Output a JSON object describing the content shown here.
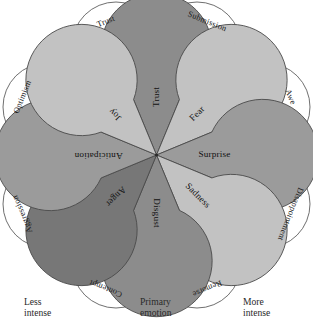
{
  "figure": {
    "background_color": "#ffffff",
    "stroke_color": "#4a4a4a"
  },
  "chart_data": {
    "type": "pie",
    "xlabel": "",
    "ylabel": "",
    "legend_position": "none",
    "grid": false,
    "categories": [
      "Trust",
      "Fear",
      "Surprise",
      "Sadness",
      "Disgust",
      "Anger",
      "Anticipation",
      "Joy"
    ],
    "values": [
      45,
      45,
      45,
      45,
      45,
      45,
      45,
      45
    ],
    "series": [
      {
        "name": "Primary emotions",
        "values": [
          45,
          45,
          45,
          45,
          45,
          45,
          45,
          45
        ]
      }
    ],
    "annotations": [
      "Less",
      "Primary",
      "More"
    ]
  },
  "petals": [
    {
      "label": "Trust",
      "color": "#8c8c8c",
      "angle": -90,
      "rotation": -90,
      "text_x": 156.5,
      "text_y": 96
    },
    {
      "label": "Fear",
      "color": "#c2c2c2",
      "angle": -45,
      "rotation": -45,
      "text_x": 198,
      "text_y": 110
    },
    {
      "label": "Surprise",
      "color": "#9b9b9b",
      "angle": 0,
      "rotation": 0,
      "text_x": 218,
      "text_y": 155
    },
    {
      "label": "Sadness",
      "color": "#c2c2c2",
      "angle": 45,
      "rotation": 45,
      "text_x": 198,
      "text_y": 200
    },
    {
      "label": "Disgust",
      "color": "#8c8c8c",
      "angle": 90,
      "rotation": 90,
      "text_x": 156.5,
      "text_y": 215
    },
    {
      "label": "Anger",
      "color": "#777777",
      "angle": 135,
      "rotation": 135,
      "text_x": 115,
      "text_y": 200
    },
    {
      "label": "Anticipation",
      "color": "#9b9b9b",
      "angle": 180,
      "rotation": 180,
      "text_x": 95,
      "text_y": 155
    },
    {
      "label": "Joy",
      "color": "#c2c2c2",
      "angle": -135,
      "rotation": -135,
      "text_x": 115,
      "text_y": 110
    }
  ],
  "dyads": [
    {
      "label": "Trust",
      "angle": -112.5,
      "cx": 116,
      "cy": 46,
      "rotation": -22,
      "color": "#ffffff"
    },
    {
      "label": "Submission",
      "angle": -67.5,
      "cx": 197,
      "cy": 46,
      "rotation": 22,
      "color": "#ffffff"
    },
    {
      "label": "Awe",
      "angle": -22.5,
      "cx": 266,
      "cy": 107,
      "rotation": 67,
      "color": "#ffffff"
    },
    {
      "label": "Disappointment",
      "angle": 22.5,
      "cx": 266,
      "cy": 204,
      "rotation": 112,
      "color": "#ffffff"
    },
    {
      "label": "Remorse",
      "angle": 67.5,
      "cx": 197,
      "cy": 264,
      "rotation": 157,
      "color": "#ffffff"
    },
    {
      "label": "Contempt",
      "angle": 112.5,
      "cx": 116,
      "cy": 264,
      "rotation": 202,
      "color": "#ffffff"
    },
    {
      "label": "Aggression",
      "angle": 157.5,
      "cx": 47,
      "cy": 204,
      "rotation": 247,
      "color": "#ffffff"
    },
    {
      "label": "Optimism",
      "angle": -157.5,
      "cx": 47,
      "cy": 107,
      "rotation": 292,
      "color": "#ffffff"
    }
  ],
  "axis": {
    "less": {
      "line1": "Less",
      "line2": "intense"
    },
    "primary": {
      "line1": "Primary",
      "line2": "emotion"
    },
    "more": {
      "line1": "More",
      "line2": "intense"
    }
  }
}
